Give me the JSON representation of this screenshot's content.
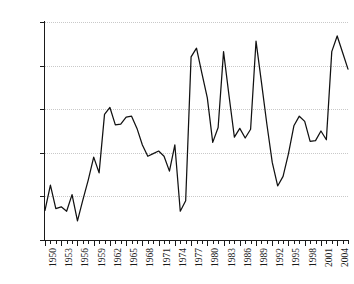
{
  "chart_data": {
    "type": "line",
    "title": "",
    "subtitle": "",
    "xlabel": "",
    "ylabel": "",
    "xlim": [
      1950,
      2006
    ],
    "ylim": [
      50,
      75
    ],
    "grid": true,
    "legend": null,
    "y_tick_labels": [
      "75%",
      "70%",
      "65%",
      "60%",
      "55%",
      "50%"
    ],
    "y_tick_values": [
      75,
      70,
      65,
      60,
      55,
      50
    ],
    "x_tick_labels": [
      "1950",
      "1953",
      "1956",
      "1959",
      "1962",
      "1965",
      "1968",
      "1971",
      "1974",
      "1977",
      "1980",
      "1983",
      "1986",
      "1989",
      "1992",
      "1995",
      "1998",
      "2001",
      "2004"
    ],
    "x_tick_values": [
      1950,
      1953,
      1956,
      1959,
      1962,
      1965,
      1968,
      1971,
      1974,
      1977,
      1980,
      1983,
      1986,
      1989,
      1992,
      1995,
      1998,
      2001,
      2004
    ],
    "x_minor_interval": 1,
    "series": [
      {
        "name": "value",
        "color": "#111111",
        "x": [
          1950,
          1951,
          1952,
          1953,
          1954,
          1955,
          1956,
          1957,
          1958,
          1959,
          1960,
          1961,
          1962,
          1963,
          1964,
          1965,
          1966,
          1967,
          1968,
          1969,
          1970,
          1971,
          1972,
          1973,
          1974,
          1975,
          1976,
          1977,
          1978,
          1979,
          1980,
          1981,
          1982,
          1983,
          1984,
          1985,
          1986,
          1987,
          1988,
          1989,
          1990,
          1991,
          1992,
          1993,
          1994,
          1995,
          1996,
          1997,
          1998,
          1999,
          2000,
          2001,
          2002,
          2003,
          2004,
          2005,
          2006
        ],
        "values": [
          53.4,
          56.3,
          53.6,
          53.8,
          53.3,
          55.2,
          52.2,
          54.6,
          56.9,
          59.5,
          57.7,
          64.4,
          65.2,
          63.2,
          63.3,
          64.1,
          64.2,
          62.8,
          60.9,
          59.6,
          59.9,
          60.2,
          59.6,
          57.9,
          60.9,
          53.3,
          54.5,
          71.0,
          72.0,
          69.1,
          66.3,
          61.2,
          62.9,
          71.6,
          66.6,
          61.8,
          62.8,
          61.7,
          62.7,
          72.8,
          68.1,
          63.3,
          58.9,
          56.2,
          57.3,
          59.9,
          63.1,
          64.2,
          63.6,
          61.3,
          61.4,
          62.5,
          61.5,
          71.6,
          73.4,
          71.5,
          69.6
        ]
      }
    ]
  },
  "axis": {
    "y_axis_name": "percent-axis",
    "x_axis_name": "year-axis"
  }
}
